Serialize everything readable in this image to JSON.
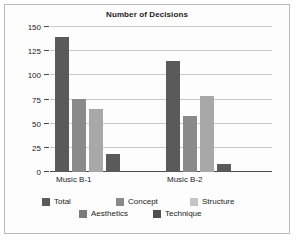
{
  "chart_data": {
    "type": "bar",
    "title": "Number of Decisions",
    "xlabel": "",
    "ylabel": "",
    "ylim": [
      0,
      150
    ],
    "yticks": [
      0,
      25,
      50,
      75,
      100,
      125,
      150
    ],
    "grid": true,
    "legend_position": "bottom",
    "categories": [
      "Music B-1",
      "Music B-2"
    ],
    "series": [
      {
        "name": "Total",
        "values": [
          140,
          115
        ],
        "color": "#5a5a5a"
      },
      {
        "name": "Aesthetics",
        "values": [
          76,
          58
        ],
        "color": "#8a8a8a"
      },
      {
        "name": "Concept",
        "values": [
          65,
          79
        ],
        "color": "#a8a8a8"
      },
      {
        "name": "Structure",
        "values": [
          null,
          null
        ],
        "color": "#c4c4c4"
      },
      {
        "name": "Technique",
        "values": [
          19,
          8
        ],
        "color": "#5a5a5a"
      }
    ],
    "plotted_bars": [
      {
        "group": "Music B-1",
        "bars": [
          {
            "series": "Total",
            "value": 140,
            "color": "#5a5a5a"
          },
          {
            "series": "Aesthetics",
            "value": 76,
            "color": "#8a8a8a"
          },
          {
            "series": "Concept",
            "value": 65,
            "color": "#a8a8a8"
          },
          {
            "series": "Technique",
            "value": 19,
            "color": "#5a5a5a"
          }
        ]
      },
      {
        "group": "Music B-2",
        "bars": [
          {
            "series": "Total",
            "value": 115,
            "color": "#5a5a5a"
          },
          {
            "series": "Aesthetics",
            "value": 58,
            "color": "#8a8a8a"
          },
          {
            "series": "Concept",
            "value": 79,
            "color": "#a8a8a8"
          },
          {
            "series": "Technique",
            "value": 8,
            "color": "#5a5a5a"
          }
        ]
      }
    ],
    "legend": [
      [
        {
          "label": "Total",
          "color": "#5a5a5a"
        },
        {
          "label": "Concept",
          "color": "#8a8a8a"
        },
        {
          "label": "Structure",
          "color": "#c4c4c4"
        }
      ],
      [
        {
          "label": "Aesthetics",
          "color": "#7b7b7b"
        },
        {
          "label": "Technique",
          "color": "#4f4f4f"
        }
      ]
    ]
  },
  "colors": {
    "gridline": "#c9c9c9",
    "axis": "#4a4a4a",
    "text": "#1c1c1c",
    "background": "#fdfdfd",
    "border": "#b9b9b9"
  }
}
